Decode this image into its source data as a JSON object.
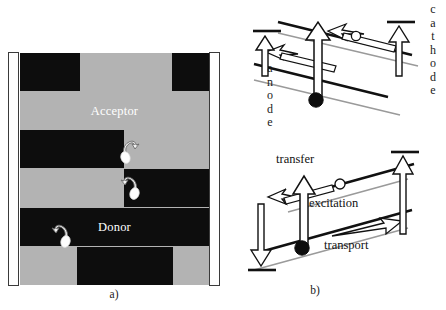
{
  "figure": {
    "type": "scientific-diagram"
  },
  "panel_a": {
    "caption": "a)",
    "electrodes": {
      "left": {
        "name": "anode-electrode-bar"
      },
      "right": {
        "name": "cathode-electrode-bar"
      }
    },
    "material_labels": {
      "acceptor": "Acceptor",
      "donor": "Donor"
    },
    "colors": {
      "donor_black": "#0d0d0d",
      "acceptor_gray": "#b3b3b3",
      "electrode_white": "#fefefe",
      "electrode_border": "#3a3a3a",
      "label_text": "#ffffff"
    },
    "stripes": [
      {
        "id": 1,
        "top": 0,
        "height": 38,
        "segments": [
          {
            "fill": "blk",
            "left": 0,
            "width": 60
          },
          {
            "fill": "gry",
            "left": 60,
            "width": 92
          },
          {
            "fill": "blk",
            "left": 152,
            "width": 37
          }
        ]
      },
      {
        "id": 2,
        "top": 39,
        "height": 37,
        "label": "Acceptor",
        "segments": [
          {
            "fill": "gry",
            "left": 0,
            "width": 189
          }
        ]
      },
      {
        "id": 3,
        "top": 77,
        "height": 38,
        "segments": [
          {
            "fill": "blk",
            "left": 0,
            "width": 104
          },
          {
            "fill": "gry",
            "left": 104,
            "width": 85
          }
        ]
      },
      {
        "id": 4,
        "top": 116,
        "height": 38,
        "segments": [
          {
            "fill": "gry",
            "left": 0,
            "width": 104
          },
          {
            "fill": "blk",
            "left": 104,
            "width": 85
          }
        ]
      },
      {
        "id": 5,
        "top": 155,
        "height": 38,
        "label": "Donor",
        "segments": [
          {
            "fill": "blk",
            "left": 0,
            "width": 189
          }
        ]
      },
      {
        "id": 6,
        "top": 194,
        "height": 38,
        "segments": [
          {
            "fill": "gry",
            "left": 0,
            "width": 57
          },
          {
            "fill": "blk",
            "left": 57,
            "width": 96
          },
          {
            "fill": "gry",
            "left": 153,
            "width": 36
          }
        ]
      }
    ],
    "excitons": [
      {
        "name": "exciton-dissociation-symbol-1",
        "left": 97,
        "top": 82,
        "flip": false
      },
      {
        "name": "exciton-dissociation-symbol-2",
        "left": 97,
        "top": 118,
        "flip": true
      },
      {
        "name": "exciton-dissociation-symbol-3",
        "left": 28,
        "top": 166,
        "flip": true
      }
    ]
  },
  "panel_b": {
    "caption": "b)",
    "electrode_labels": {
      "anode": [
        "a",
        "n",
        "o",
        "d",
        "e"
      ],
      "cathode": [
        "c",
        "a",
        "t",
        "h",
        "o",
        "d",
        "e"
      ]
    },
    "process_labels": {
      "transfer": "transfer",
      "excitation": "excitation",
      "transport": "transport"
    },
    "colors": {
      "lumo_homo_line": "#111111",
      "secondary_line": "#9a9a9a",
      "arrow_outline": "#111111",
      "arrow_fill": "#ffffff",
      "electron_dot": "#0d0d0d",
      "hole_dot": "#ffffff"
    },
    "diagram_top": {
      "name": "charge-separation-at-interface-diagram",
      "features": [
        "tilted donor band",
        "tilted acceptor band",
        "electron transfer arrow",
        "anode up-arrow",
        "cathode up-arrow",
        "electron dot",
        "hole circle"
      ]
    },
    "diagram_bottom": {
      "name": "excitation-transfer-transport-diagram",
      "features": [
        "tilted bands",
        "excitation vertical arrow",
        "transfer arrow",
        "transport arrow",
        "cathode up-arrow",
        "anode down-arrow",
        "electron dot",
        "hole circle"
      ]
    }
  }
}
